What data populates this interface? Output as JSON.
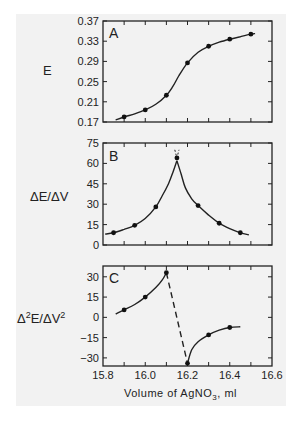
{
  "chart_data": [
    {
      "type": "line",
      "panel": "A",
      "ylabel": "E",
      "ylim": [
        0.17,
        0.37
      ],
      "yticks": [
        0.17,
        0.21,
        0.25,
        0.29,
        0.33,
        0.37
      ],
      "ytick_labels": [
        "0.17",
        "0.21",
        "0.25",
        "0.29",
        "0.33",
        "0.37"
      ],
      "xlim": [
        15.8,
        16.6
      ],
      "x": [
        15.9,
        16.0,
        16.1,
        16.2,
        16.3,
        16.4,
        16.5
      ],
      "values": [
        0.18,
        0.194,
        0.223,
        0.287,
        0.32,
        0.334,
        0.344
      ],
      "curve": [
        [
          15.86,
          0.174
        ],
        [
          15.9,
          0.18
        ],
        [
          15.95,
          0.186
        ],
        [
          16.0,
          0.194
        ],
        [
          16.05,
          0.205
        ],
        [
          16.1,
          0.223
        ],
        [
          16.13,
          0.24
        ],
        [
          16.16,
          0.262
        ],
        [
          16.2,
          0.287
        ],
        [
          16.25,
          0.308
        ],
        [
          16.3,
          0.32
        ],
        [
          16.35,
          0.328
        ],
        [
          16.4,
          0.334
        ],
        [
          16.45,
          0.339
        ],
        [
          16.5,
          0.344
        ],
        [
          16.52,
          0.345
        ]
      ],
      "grid": false
    },
    {
      "type": "line",
      "panel": "B",
      "ylabel": "ΔE/ΔV",
      "ylim": [
        0,
        75
      ],
      "yticks": [
        0,
        15,
        30,
        45,
        60,
        75
      ],
      "ytick_labels": [
        "0",
        "15",
        "30",
        "45",
        "60",
        "75"
      ],
      "xlim": [
        15.8,
        16.6
      ],
      "x": [
        15.85,
        15.95,
        16.05,
        16.15,
        16.25,
        16.35,
        16.45
      ],
      "values": [
        9,
        14.5,
        28,
        64,
        29,
        16,
        9
      ],
      "curve_left": [
        [
          15.81,
          8
        ],
        [
          15.85,
          9
        ],
        [
          15.9,
          11.5
        ],
        [
          15.95,
          14.5
        ],
        [
          16.0,
          19.5
        ],
        [
          16.05,
          28
        ],
        [
          16.08,
          36
        ],
        [
          16.11,
          45
        ],
        [
          16.13,
          53
        ],
        [
          16.15,
          62
        ]
      ],
      "curve_right": [
        [
          16.15,
          62
        ],
        [
          16.17,
          52
        ],
        [
          16.19,
          42
        ],
        [
          16.22,
          34
        ],
        [
          16.25,
          29
        ],
        [
          16.3,
          22
        ],
        [
          16.35,
          16
        ],
        [
          16.4,
          12
        ],
        [
          16.45,
          9
        ],
        [
          16.49,
          7.5
        ]
      ],
      "peak_dashed": [
        [
          16.14,
          70
        ],
        [
          16.15,
          64
        ],
        [
          16.16,
          70
        ]
      ],
      "grid": false
    },
    {
      "type": "line",
      "panel": "C",
      "ylabel": "Δ²E/ΔV²",
      "ylim": [
        -36,
        38
      ],
      "yticks": [
        -30,
        -15,
        0,
        15,
        30
      ],
      "ytick_labels": [
        "−30",
        "−15",
        "0",
        "15",
        "30"
      ],
      "xlim": [
        15.8,
        16.6
      ],
      "xticks": [
        15.8,
        16.0,
        16.2,
        16.4,
        16.6
      ],
      "xtick_labels": [
        "15.8",
        "16.0",
        "16.2",
        "16.4",
        "16.6"
      ],
      "x": [
        15.9,
        16.0,
        16.1,
        16.2,
        16.3,
        16.4
      ],
      "values": [
        5.5,
        15,
        33,
        -34,
        -13,
        -7.5
      ],
      "curve_left": [
        [
          15.86,
          2.5
        ],
        [
          15.9,
          5.5
        ],
        [
          15.95,
          9.5
        ],
        [
          16.0,
          15
        ],
        [
          16.05,
          22
        ],
        [
          16.08,
          27.5
        ],
        [
          16.1,
          33
        ]
      ],
      "curve_right": [
        [
          16.2,
          -34
        ],
        [
          16.22,
          -24
        ],
        [
          16.25,
          -18
        ],
        [
          16.3,
          -13
        ],
        [
          16.35,
          -9.5
        ],
        [
          16.4,
          -7.5
        ],
        [
          16.45,
          -7
        ]
      ],
      "dashed_segment": [
        [
          16.1,
          33
        ],
        [
          16.2,
          -34
        ]
      ],
      "xlabel": "Volume of AgNO₃, ml",
      "grid": false
    }
  ],
  "panels": {
    "A": {
      "letter": "A",
      "ylabel": "E"
    },
    "B": {
      "letter": "B",
      "ylabel": "ΔE/ΔV"
    },
    "C": {
      "letter": "C",
      "ylabel_main": "Δ",
      "ylabel_sup": "2",
      "ylabel_mid": "E/ΔV",
      "ylabel_sup2": "2"
    }
  },
  "xaxis": {
    "label_main": "Volume of AgNO",
    "label_sub": "3",
    "label_tail": ", ml"
  }
}
